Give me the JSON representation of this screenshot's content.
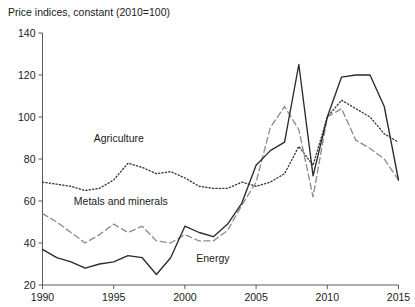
{
  "chart_data": {
    "type": "line",
    "title": "Price indices, constant (2010=100)",
    "xlabel": "",
    "ylabel": "",
    "xlim": [
      1990,
      2015
    ],
    "ylim": [
      20,
      140
    ],
    "ytick_labels": [
      "140",
      "120",
      "100",
      "80",
      "60",
      "40",
      "20"
    ],
    "yticks": [
      140,
      120,
      100,
      80,
      60,
      40,
      20
    ],
    "xtick_labels": [
      "1990",
      "1995",
      "2000",
      "2005",
      "2010",
      "2015"
    ],
    "xticks": [
      1990,
      1995,
      2000,
      2005,
      2010,
      2015
    ],
    "grid": false,
    "legend": "inline-annotations",
    "x": [
      1990,
      1991,
      1992,
      1993,
      1994,
      1995,
      1996,
      1997,
      1998,
      1999,
      2000,
      2001,
      2002,
      2003,
      2004,
      2005,
      2006,
      2007,
      2008,
      2009,
      2010,
      2011,
      2012,
      2013,
      2014,
      2015
    ],
    "series": [
      {
        "name": "Agriculture",
        "style": "dotted",
        "label_x": 1993.6,
        "label_y": 88,
        "values": [
          69,
          68,
          67,
          65,
          66,
          70,
          78,
          76,
          73,
          74,
          71,
          67,
          66,
          66,
          69,
          67,
          69,
          73,
          86,
          77,
          100,
          108,
          104,
          100,
          92,
          88
        ]
      },
      {
        "name": "Metals and minerals",
        "style": "dashed",
        "label_x": 1992.2,
        "label_y": 58,
        "values": [
          54,
          50,
          45,
          40,
          44,
          49,
          45,
          48,
          41,
          40,
          44,
          41,
          41,
          46,
          58,
          69,
          95,
          105,
          94,
          62,
          100,
          104,
          89,
          85,
          80,
          70
        ]
      },
      {
        "name": "Energy",
        "style": "solid",
        "label_x": 2000.8,
        "label_y": 31,
        "values": [
          37,
          33,
          31,
          28,
          30,
          31,
          34,
          33,
          25,
          33,
          48,
          45,
          43,
          49,
          59,
          77,
          84,
          88,
          125,
          72,
          100,
          119,
          120,
          120,
          105,
          70
        ]
      }
    ]
  }
}
